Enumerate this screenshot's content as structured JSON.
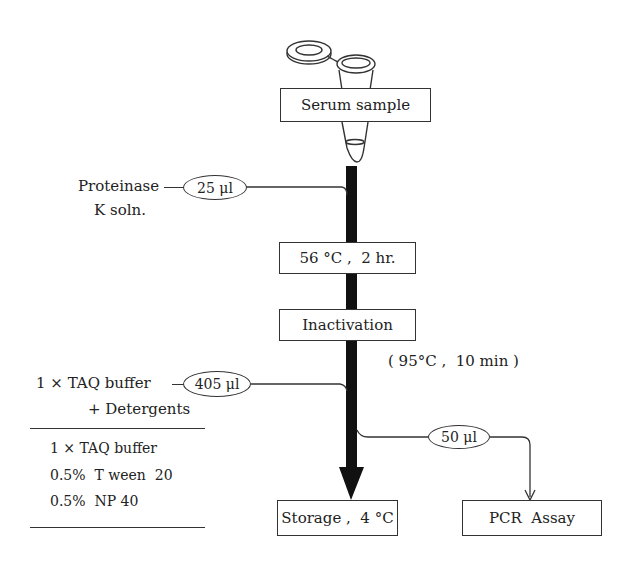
{
  "diagram": {
    "type": "flowchart",
    "colors": {
      "line": "#333333",
      "main_arrow": "#111111",
      "background": "#ffffff"
    },
    "nodes": {
      "serum": "Serum sample",
      "incubation": "56 °C ,  2 hr.",
      "inactivation": "Inactivation",
      "inactivation_note": "( 95°C ,  10 min )",
      "storage": "Storage ,  4 °C",
      "pcr": "PCR  Assay"
    },
    "inputs": {
      "proteinase": {
        "label_line1": "Proteinase",
        "label_line2": "K soln.",
        "volume": "25 μl"
      },
      "taq": {
        "label_line1": "1 × TAQ buffer",
        "label_line2": "+ Detergents",
        "volume": "405 μl"
      },
      "aliquot": {
        "volume": "50 μl"
      }
    },
    "legend": {
      "items": [
        "1 × TAQ buffer",
        "0.5%  T ween  20",
        "0.5%  NP 40"
      ]
    },
    "icons": {
      "tube": "microcentrifuge-tube-icon"
    }
  }
}
